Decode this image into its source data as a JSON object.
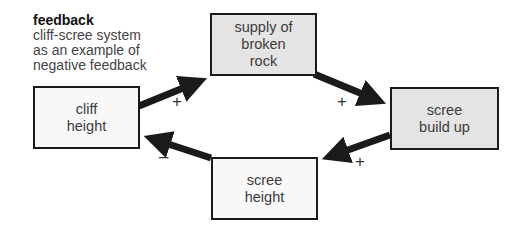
{
  "caption": {
    "title": "feedback",
    "lines": [
      "cliff-scree system",
      "as an example of",
      "negative feedback"
    ]
  },
  "nodes": {
    "supply": {
      "line1": "supply of",
      "line2": "broken",
      "line3": "rock"
    },
    "cliff": {
      "line1": "cliff",
      "line2": "height"
    },
    "scree_buildup": {
      "line1": "scree",
      "line2": "build up"
    },
    "scree_height": {
      "line1": "scree",
      "line2": "height"
    }
  },
  "edges": [
    {
      "from": "cliff height",
      "to": "supply of broken rock",
      "sign": "+"
    },
    {
      "from": "supply of broken rock",
      "to": "scree build up",
      "sign": "+"
    },
    {
      "from": "scree build up",
      "to": "scree height",
      "sign": "+"
    },
    {
      "from": "scree height",
      "to": "cliff height",
      "sign": "–"
    }
  ],
  "colors": {
    "shaded_box": "#e4e4e4",
    "plain_box": "#f8f8f8",
    "arrow": "#1a1a1a"
  }
}
